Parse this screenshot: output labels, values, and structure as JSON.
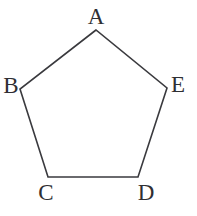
{
  "figure": {
    "kind": "geometry-diagram",
    "shape_name": "pentagon",
    "canvas": {
      "width": 197,
      "height": 216
    },
    "background_color": "#ffffff",
    "stroke_color": "#3a3a3e",
    "stroke_width": 1.6,
    "fill_color": "none",
    "label_color": "#2f2f33",
    "label_font_size": 23,
    "vertices": [
      {
        "id": "A",
        "label": "A",
        "x": 96,
        "y": 30,
        "label_cx": 96,
        "label_top": 5
      },
      {
        "id": "B",
        "label": "B",
        "x": 20,
        "y": 89,
        "label_cx": 11,
        "label_top": 74
      },
      {
        "id": "C",
        "label": "C",
        "x": 48,
        "y": 177,
        "label_cx": 46,
        "label_top": 181
      },
      {
        "id": "D",
        "label": "D",
        "x": 138,
        "y": 177,
        "label_cx": 146,
        "label_top": 181
      },
      {
        "id": "E",
        "label": "E",
        "x": 167,
        "y": 88,
        "label_cx": 178,
        "label_top": 73
      }
    ],
    "edges": [
      {
        "from": "A",
        "to": "B"
      },
      {
        "from": "B",
        "to": "C"
      },
      {
        "from": "C",
        "to": "D"
      },
      {
        "from": "D",
        "to": "E"
      },
      {
        "from": "E",
        "to": "A"
      }
    ],
    "polygon_points": "96,30 167,88 138,177 48,177 20,89"
  }
}
